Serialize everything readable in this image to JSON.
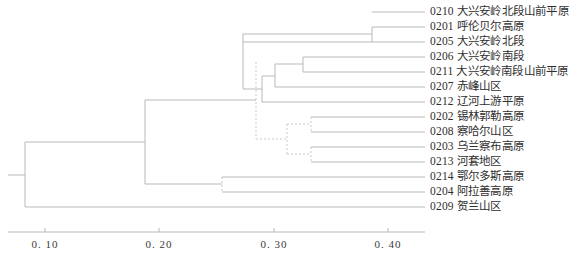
{
  "figure": {
    "type": "dendrogram",
    "orientation": "left-to-right",
    "line_color": "#b9b9b9",
    "dashed_color": "#c9c9c9",
    "text_color": "#2f2f2f"
  },
  "axis": {
    "label": "",
    "ticks": [
      {
        "value": 0.1,
        "label": "0. 10",
        "x": 45
      },
      {
        "value": 0.2,
        "label": "0. 20",
        "x": 159
      },
      {
        "value": 0.3,
        "label": "0. 30",
        "x": 274
      },
      {
        "value": 0.4,
        "label": "0. 40",
        "x": 388
      }
    ],
    "line_y": 232,
    "tick_label_y": 238,
    "range": [
      0.0,
      0.46
    ]
  },
  "leaves": [
    {
      "id": "L1",
      "code": "0210",
      "name": "大兴安岭北段山前平原",
      "y": 12,
      "x_start": 372
    },
    {
      "id": "L2",
      "code": "0201",
      "name": "呼伦贝尔高原",
      "y": 27,
      "x_start": 372
    },
    {
      "id": "L3",
      "code": "0205",
      "name": "大兴安岭北段",
      "y": 42,
      "x_start": 243
    },
    {
      "id": "L4",
      "code": "0206",
      "name": "大兴安岭南段",
      "y": 57,
      "x_start": 303
    },
    {
      "id": "L5",
      "code": "0211",
      "name": "大兴安岭南段山前平原",
      "y": 72,
      "x_start": 303
    },
    {
      "id": "L6",
      "code": "0207",
      "name": "赤峰山区",
      "y": 87,
      "x_start": 275
    },
    {
      "id": "L7",
      "code": "0212",
      "name": "辽河上游平原",
      "y": 102,
      "x_start": 262
    },
    {
      "id": "L8",
      "code": "0202",
      "name": "锡林郭勒高原",
      "y": 117,
      "x_start": 311
    },
    {
      "id": "L9",
      "code": "0208",
      "name": "察哈尔山区",
      "y": 132,
      "x_start": 311
    },
    {
      "id": "L10",
      "code": "0203",
      "name": "乌兰察布高原",
      "y": 147,
      "x_start": 311
    },
    {
      "id": "L11",
      "code": "0213",
      "name": "河套地区",
      "y": 162,
      "x_start": 311
    },
    {
      "id": "L12",
      "code": "0214",
      "name": "鄂尔多斯高原",
      "y": 177,
      "x_start": 222
    },
    {
      "id": "L13",
      "code": "0204",
      "name": "阿拉善高原",
      "y": 192,
      "x_start": 222
    },
    {
      "id": "L14",
      "code": "0209",
      "name": "贺兰山区",
      "y": 207,
      "x_start": 25
    }
  ],
  "leaf_line_end_x": 425,
  "label_x": 430,
  "chart_data": {
    "type": "dendrogram",
    "title": "",
    "xlabel": "",
    "ylabel": "",
    "xlim": [
      0.0,
      0.46
    ],
    "xticks": [
      0.1,
      0.2,
      0.3,
      0.4
    ],
    "grid": false,
    "legend": "none",
    "categories": [
      "0210 大兴安岭北段山前平原",
      "0201 呼伦贝尔高原",
      "0205 大兴安岭北段",
      "0206 大兴安岭南段",
      "0211 大兴安岭南段山前平原",
      "0207 赤峰山区",
      "0212 辽河上游平原",
      "0202 锡林郭勒高原",
      "0208 察哈尔山区",
      "0203 乌兰察布高原",
      "0213 河套地区",
      "0214 鄂尔多斯高原",
      "0204 阿拉善高原",
      "0209 贺兰山区"
    ],
    "merges": [
      {
        "id": "N1",
        "children": [
          "0201",
          "0205"
        ],
        "distance": 0.386,
        "x": 372,
        "y1": 27,
        "y2": 42,
        "style": "solid"
      },
      {
        "id": "N2",
        "children": [
          "0206",
          "0211"
        ],
        "distance": 0.326,
        "x": 303,
        "y1": 57,
        "y2": 72,
        "style": "solid"
      },
      {
        "id": "N3",
        "children": [
          "N2",
          "0207"
        ],
        "distance": 0.301,
        "x": 275,
        "y1": 64,
        "y2": 87,
        "style": "solid"
      },
      {
        "id": "N4",
        "children": [
          "N3",
          "0212"
        ],
        "distance": 0.289,
        "x": 262,
        "y1": 76,
        "y2": 102,
        "style": "solid"
      },
      {
        "id": "N5",
        "children": [
          "N1",
          "N4"
        ],
        "distance": 0.273,
        "x": 243,
        "y1": 34,
        "y2": 89,
        "style": "solid"
      },
      {
        "id": "N6",
        "children": [
          "0202",
          "0208"
        ],
        "distance": 0.333,
        "x": 311,
        "y1": 117,
        "y2": 132,
        "style": "dashed"
      },
      {
        "id": "N7",
        "children": [
          "0203",
          "0213"
        ],
        "distance": 0.333,
        "x": 311,
        "y1": 147,
        "y2": 162,
        "style": "dashed"
      },
      {
        "id": "N8",
        "children": [
          "N6",
          "N7"
        ],
        "distance": 0.289,
        "x": 287,
        "y1": 124,
        "y2": 154,
        "style": "dashed"
      },
      {
        "id": "N9",
        "children": [
          "N5",
          "N8"
        ],
        "distance": 0.244,
        "x": 256,
        "y1": 62,
        "y2": 139,
        "style": "dashed"
      },
      {
        "id": "N10",
        "children": [
          "0214",
          "0204"
        ],
        "distance": 0.228,
        "x": 222,
        "y1": 177,
        "y2": 192,
        "style": "dashed"
      },
      {
        "id": "N11",
        "children": [
          "N9",
          "N10"
        ],
        "distance": 0.158,
        "x": 145,
        "y1": 100,
        "y2": 184,
        "style": "solid"
      },
      {
        "id": "N12",
        "children": [
          "N11",
          "0209"
        ],
        "distance": 0.075,
        "x": 25,
        "y1": 142,
        "y2": 207,
        "style": "solid"
      }
    ]
  }
}
